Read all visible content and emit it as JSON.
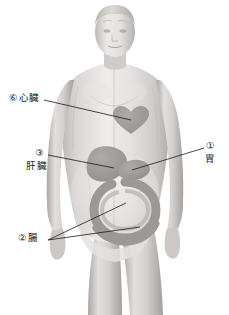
{
  "illustration": {
    "title": "人体内臓図",
    "subject": "男性人体 正面 内臓位置図",
    "background_color": "#ffffff",
    "style": "grayscale anatomical illustration"
  },
  "palette": {
    "line": "#1a1a1a",
    "text": "#1a1a1a",
    "skin_light": "#eceaea",
    "skin_mid": "#d8d5d4",
    "skin_shadow": "#bfbcba",
    "skin_deep": "#a7a3a1",
    "hair": "#cfcbc7",
    "organ_fill": "#9d9a99",
    "organ_fill_light": "#b3b0af",
    "organ_stroke": "#8a8786"
  },
  "labels": [
    {
      "id": "heart",
      "number": "⑥",
      "name": "心臓",
      "reading": "heart",
      "leader": {
        "from_x": 44,
        "to_x": 129,
        "from_y": 100,
        "to_y": 118
      }
    },
    {
      "id": "liver",
      "number": "③",
      "name": "肝臓",
      "reading": "liver",
      "leader": {
        "from_x": 48,
        "to_x": 112,
        "from_y": 155,
        "to_y": 168
      }
    },
    {
      "id": "stomach",
      "number": "①",
      "name": "胃",
      "reading": "stomach",
      "leader": {
        "from_x": 204,
        "to_x": 133,
        "from_y": 148,
        "to_y": 170
      }
    },
    {
      "id": "intestine",
      "number": "②",
      "name": "腸",
      "reading": "intestine",
      "leader": {
        "from_x": 48,
        "to_x": 124,
        "from_y": 240,
        "to_y": 205
      },
      "leader2": {
        "from_x": 48,
        "to_x": 136,
        "from_y": 240,
        "to_y": 228
      }
    }
  ],
  "organs": [
    {
      "id": "heart",
      "label": "心臓",
      "shape": "heart-symbol",
      "cx": 131,
      "cy": 124
    },
    {
      "id": "liver",
      "label": "肝臓",
      "shape": "lobed-blob",
      "cx": 110,
      "cy": 166
    },
    {
      "id": "stomach",
      "label": "胃",
      "shape": "oval",
      "cx": 134,
      "cy": 170
    },
    {
      "id": "intestine",
      "label": "腸",
      "shape": "ring",
      "cx": 125,
      "cy": 205
    }
  ]
}
